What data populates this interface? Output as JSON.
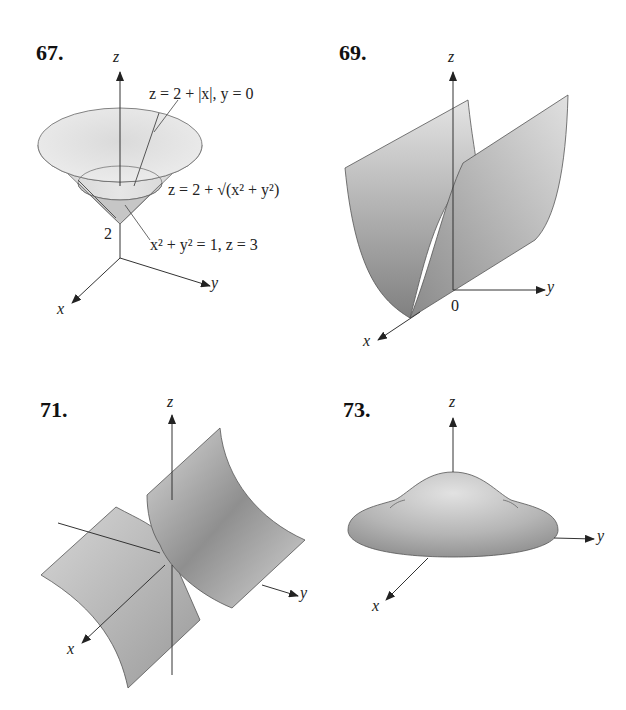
{
  "figures": [
    {
      "number": "67.",
      "axes": {
        "z": "z",
        "x": "x",
        "y": "y"
      },
      "tick": "2",
      "annotations": [
        {
          "text": "z = 2 + |x|, y = 0"
        },
        {
          "text": "z = 2 + √(x² + y²)"
        },
        {
          "text": "x² + y² = 1, z = 3"
        }
      ],
      "surface": "cone"
    },
    {
      "number": "69.",
      "axes": {
        "z": "z",
        "x": "x",
        "y": "y"
      },
      "origin": "0",
      "surface": "parabolic-cylinder"
    },
    {
      "number": "71.",
      "axes": {
        "z": "z",
        "x": "x",
        "y": "y"
      },
      "surface": "hyperbolic-cylinder"
    },
    {
      "number": "73.",
      "axes": {
        "z": "z",
        "x": "x",
        "y": "y"
      },
      "surface": "bump"
    }
  ],
  "colors": {
    "surface_light": "#dedede",
    "surface_dark": "#8a8a8a",
    "line": "#333333"
  }
}
